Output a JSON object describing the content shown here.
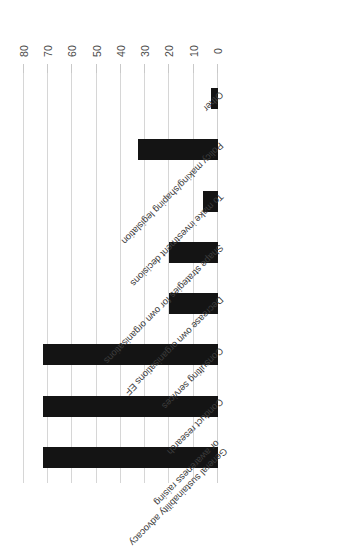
{
  "chart_data": {
    "type": "bar",
    "orientation": "horizontal",
    "title": "",
    "subtitle": "",
    "xlabel": "",
    "ylabel": "",
    "categories": [
      "General sustainability advocacy or awareness raising",
      "Conduct research",
      "Consulting services",
      "Decrease own organisations EF",
      "Shape strategies for own organisations",
      "To make investment decisions",
      "Policy making/shaping legislation",
      "Other"
    ],
    "category_lines": [
      [
        "General sustainability advocacy",
        "or awareness raising"
      ],
      [
        "Conduct research"
      ],
      [
        "Consulting services"
      ],
      [
        "Decrease own organisations EF"
      ],
      [
        "Shape strategies for own organisations"
      ],
      [
        "To make investment decisions"
      ],
      [
        "Policy making/shaping legislation"
      ],
      [
        "Other"
      ]
    ],
    "values": [
      72,
      72,
      72,
      20,
      20,
      6,
      33,
      3
    ],
    "xlim": [
      0,
      80
    ],
    "xticks": [
      0,
      10,
      20,
      30,
      40,
      50,
      60,
      70,
      80
    ],
    "xtick_labels": [
      "0",
      "10",
      "20",
      "30",
      "40",
      "50",
      "60",
      "70",
      "80"
    ],
    "grid": true,
    "legend": false,
    "bar_color": "#141414",
    "gridline_color": "#d6d6d6",
    "tick_label_color": "#4a4a4a",
    "category_label_color": "#3d3d3d",
    "background_color": "#ffffff",
    "rotated_180": true
  }
}
